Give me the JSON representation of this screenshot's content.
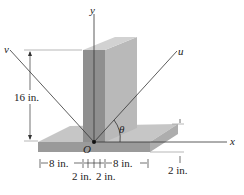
{
  "diagram": {
    "type": "engineering-statics-figure",
    "axes": {
      "x_label": "x",
      "y_label": "y",
      "u_label": "u",
      "v_label": "v",
      "origin_label": "O",
      "angle_label": "θ"
    },
    "dimensions": {
      "height": "16 in.",
      "left_width": "8 in.",
      "right_width": "8 in.",
      "center_left": "2 in.",
      "center_right": "2 in.",
      "plate_thickness": "2 in."
    },
    "colors": {
      "wall_front": "#8f8f8f",
      "wall_side": "#b8b8b8",
      "wall_top": "#cfcfcf",
      "plate_top": "#c4c4c4",
      "plate_front": "#9a9a9a",
      "line": "#333333"
    }
  }
}
